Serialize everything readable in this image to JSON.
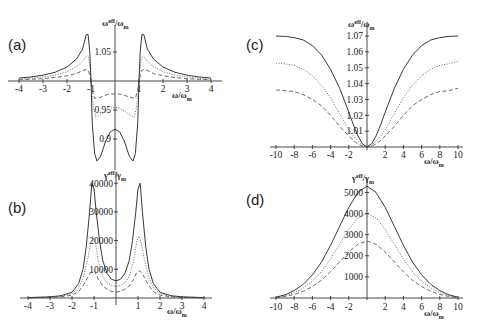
{
  "chart_data": [
    {
      "id": "a",
      "panel_label": "(a)",
      "type": "line",
      "xlabel": "ω/ω_m",
      "ylabel": "ω^eff/ω_m",
      "xlim": [
        -4.1,
        4.1
      ],
      "x_ticks": [
        -4,
        -3,
        -2,
        -1,
        1,
        2,
        3,
        4
      ],
      "y_ticks": [
        1.05,
        0.95,
        0.9
      ],
      "axis_origin": [
        0,
        1.0
      ],
      "pixel_map": {
        "x0": 115,
        "px_per_x": 24,
        "y0": 81,
        "y_ref": 1.0,
        "px_per_y": 580
      },
      "series": [
        {
          "name": "solid",
          "style": "solid",
          "x": [
            -4,
            -3.5,
            -3,
            -2.5,
            -2,
            -1.6,
            -1.35,
            -1.2,
            -1.12,
            -1.05,
            -1.0,
            -0.95,
            -0.85,
            -0.75,
            -0.6,
            -0.4,
            -0.2,
            0,
            0.2,
            0.4,
            0.6,
            0.75,
            0.85,
            0.95,
            1.0,
            1.05,
            1.12,
            1.2,
            1.35,
            1.6,
            2,
            2.5,
            3,
            3.5,
            4
          ],
          "y": [
            1.005,
            1.007,
            1.01,
            1.015,
            1.024,
            1.038,
            1.055,
            1.08,
            1.08,
            1.05,
            1.0,
            0.93,
            0.875,
            0.862,
            0.87,
            0.895,
            0.912,
            0.917,
            0.912,
            0.895,
            0.87,
            0.862,
            0.875,
            0.93,
            1.0,
            1.05,
            1.08,
            1.08,
            1.055,
            1.038,
            1.024,
            1.015,
            1.01,
            1.007,
            1.005
          ]
        },
        {
          "name": "dotted",
          "style": "dotted",
          "x": [
            -4,
            -3.5,
            -3,
            -2.5,
            -2,
            -1.6,
            -1.35,
            -1.2,
            -1.1,
            -1.03,
            -0.98,
            -0.9,
            -0.8,
            -0.6,
            -0.4,
            -0.2,
            0,
            0.2,
            0.4,
            0.6,
            0.8,
            0.9,
            0.98,
            1.03,
            1.1,
            1.2,
            1.35,
            1.6,
            2,
            2.5,
            3,
            3.5,
            4
          ],
          "y": [
            1.003,
            1.005,
            1.007,
            1.01,
            1.016,
            1.025,
            1.034,
            1.042,
            1.04,
            1.02,
            0.99,
            0.955,
            0.938,
            0.942,
            0.948,
            0.953,
            0.955,
            0.953,
            0.948,
            0.942,
            0.938,
            0.955,
            0.99,
            1.02,
            1.04,
            1.042,
            1.034,
            1.025,
            1.016,
            1.01,
            1.007,
            1.005,
            1.003
          ]
        },
        {
          "name": "dashed",
          "style": "dashed",
          "x": [
            -4,
            -3.5,
            -3,
            -2.5,
            -2,
            -1.6,
            -1.35,
            -1.2,
            -1.1,
            -1.0,
            -0.95,
            -0.85,
            -0.6,
            -0.3,
            0,
            0.3,
            0.6,
            0.85,
            0.95,
            1.0,
            1.1,
            1.2,
            1.35,
            1.6,
            2,
            2.5,
            3,
            3.5,
            4
          ],
          "y": [
            1.002,
            1.003,
            1.004,
            1.006,
            1.009,
            1.013,
            1.018,
            1.02,
            1.018,
            1.0,
            0.985,
            0.97,
            0.972,
            0.977,
            0.978,
            0.977,
            0.972,
            0.97,
            0.985,
            1.0,
            1.018,
            1.02,
            1.018,
            1.013,
            1.009,
            1.006,
            1.004,
            1.003,
            1.002
          ]
        }
      ]
    },
    {
      "id": "b",
      "panel_label": "(b)",
      "type": "line",
      "xlabel": "ω/ω_m",
      "ylabel": "γ^eff/γ_m",
      "xlim": [
        -4.1,
        4.1
      ],
      "ylim": [
        0,
        40000
      ],
      "x_ticks": [
        -4,
        -3,
        -2,
        -1,
        1,
        2,
        3,
        4
      ],
      "y_ticks": [
        10000,
        20000,
        30000,
        40000
      ],
      "pixel_map": {
        "x0": 116,
        "px_per_x": 22,
        "y0": 298,
        "y_ref": 0,
        "px_per_y": 0.00287
      },
      "series": [
        {
          "name": "solid",
          "style": "solid",
          "x": [
            -4,
            -3,
            -2.5,
            -2,
            -1.7,
            -1.5,
            -1.35,
            -1.2,
            -1.1,
            -1.0,
            -0.9,
            -0.75,
            -0.6,
            -0.4,
            -0.2,
            0,
            0.2,
            0.4,
            0.6,
            0.75,
            0.9,
            1.0,
            1.1,
            1.2,
            1.35,
            1.5,
            1.7,
            2,
            2.5,
            3,
            4
          ],
          "y": [
            150,
            400,
            800,
            2000,
            5000,
            10000,
            18000,
            30000,
            40000,
            38000,
            30000,
            20000,
            13000,
            8500,
            6500,
            6000,
            6500,
            8500,
            13000,
            20000,
            30000,
            38000,
            40000,
            30000,
            18000,
            10000,
            5000,
            2000,
            800,
            400,
            150
          ]
        },
        {
          "name": "dotted",
          "style": "dotted",
          "x": [
            -4,
            -3,
            -2.5,
            -2,
            -1.7,
            -1.5,
            -1.3,
            -1.15,
            -1.05,
            -0.95,
            -0.8,
            -0.6,
            -0.4,
            -0.2,
            0,
            0.2,
            0.4,
            0.6,
            0.8,
            0.95,
            1.05,
            1.15,
            1.3,
            1.5,
            1.7,
            2,
            2.5,
            3,
            4
          ],
          "y": [
            100,
            300,
            600,
            1500,
            3500,
            7000,
            13000,
            19000,
            21500,
            20000,
            13000,
            7500,
            5200,
            4300,
            4000,
            4300,
            5200,
            7500,
            13000,
            20000,
            21500,
            19000,
            13000,
            7000,
            3500,
            1500,
            600,
            300,
            100
          ]
        },
        {
          "name": "dashed",
          "style": "dashed",
          "x": [
            -4,
            -3,
            -2.5,
            -2,
            -1.7,
            -1.5,
            -1.3,
            -1.15,
            -1.05,
            -0.95,
            -0.8,
            -0.6,
            -0.4,
            -0.2,
            0,
            0.2,
            0.4,
            0.6,
            0.8,
            0.95,
            1.05,
            1.15,
            1.3,
            1.5,
            1.7,
            2,
            2.5,
            3,
            4
          ],
          "y": [
            60,
            200,
            400,
            1000,
            2200,
            4200,
            7000,
            9000,
            9500,
            9000,
            6500,
            4200,
            3000,
            2300,
            2100,
            2300,
            3000,
            4200,
            6500,
            9000,
            9500,
            9000,
            7000,
            4200,
            2200,
            1000,
            400,
            200,
            60
          ]
        }
      ]
    },
    {
      "id": "c",
      "panel_label": "(c)",
      "type": "line",
      "xlabel": "ω/ω_m",
      "ylabel": "ω^eff/ω_m",
      "xlim": [
        -10,
        10
      ],
      "ylim": [
        1.0,
        1.07
      ],
      "x_ticks": [
        -10,
        -8,
        -6,
        -4,
        -2,
        2,
        4,
        6,
        8,
        10
      ],
      "y_ticks": [
        1.01,
        1.02,
        1.03,
        1.04,
        1.05,
        1.06,
        1.07
      ],
      "pixel_map": {
        "x0": 367,
        "px_per_x": 9.1,
        "y0": 147,
        "y_ref": 1.0,
        "px_per_y": 1585
      },
      "series": [
        {
          "name": "solid",
          "style": "solid",
          "x": [
            -10,
            -9,
            -8,
            -7,
            -6,
            -5,
            -4,
            -3,
            -2,
            -1.5,
            -1,
            -0.5,
            0,
            0.5,
            1,
            1.5,
            2,
            3,
            4,
            5,
            6,
            7,
            8,
            9,
            10
          ],
          "y": [
            1.07,
            1.0698,
            1.069,
            1.0675,
            1.064,
            1.058,
            1.049,
            1.037,
            1.022,
            1.014,
            1.007,
            1.002,
            1.0,
            1.002,
            1.007,
            1.014,
            1.022,
            1.037,
            1.049,
            1.058,
            1.064,
            1.0675,
            1.069,
            1.0698,
            1.07
          ]
        },
        {
          "name": "dotted",
          "style": "dotted",
          "x": [
            -10,
            -9,
            -8,
            -7,
            -6,
            -5,
            -4,
            -3,
            -2,
            -1.5,
            -1,
            -0.5,
            0,
            0.5,
            1,
            1.5,
            2,
            3,
            4,
            5,
            6,
            7,
            8,
            9,
            10
          ],
          "y": [
            1.053,
            1.0525,
            1.0515,
            1.049,
            1.045,
            1.039,
            1.031,
            1.021,
            1.011,
            1.007,
            1.004,
            1.001,
            1.0,
            1.001,
            1.004,
            1.007,
            1.011,
            1.021,
            1.031,
            1.039,
            1.045,
            1.049,
            1.0515,
            1.0525,
            1.054
          ]
        },
        {
          "name": "dashed",
          "style": "dashed",
          "x": [
            -10,
            -9,
            -8,
            -7,
            -6,
            -5,
            -4,
            -3,
            -2,
            -1.5,
            -1,
            -0.5,
            0,
            0.5,
            1,
            1.5,
            2,
            3,
            4,
            5,
            6,
            7,
            8,
            9,
            10
          ],
          "y": [
            1.036,
            1.0355,
            1.035,
            1.033,
            1.03,
            1.026,
            1.02,
            1.013,
            1.007,
            1.004,
            1.002,
            1.0005,
            1.0,
            1.0005,
            1.002,
            1.004,
            1.007,
            1.013,
            1.02,
            1.026,
            1.03,
            1.033,
            1.035,
            1.0355,
            1.037
          ]
        }
      ]
    },
    {
      "id": "d",
      "panel_label": "(d)",
      "type": "line",
      "xlabel": "ω/ω_m",
      "ylabel": "γ^eff/γ_m",
      "xlim": [
        -10,
        10
      ],
      "ylim": [
        0,
        5000
      ],
      "x_ticks": [
        -10,
        -8,
        -6,
        -4,
        -2,
        2,
        4,
        6,
        8,
        10
      ],
      "y_ticks": [
        1000,
        2000,
        3000,
        4000,
        5000
      ],
      "pixel_map": {
        "x0": 367,
        "px_per_x": 9.1,
        "y0": 298,
        "y_ref": 0,
        "px_per_y": 0.0211
      },
      "series": [
        {
          "name": "solid",
          "style": "solid",
          "x": [
            -10,
            -9,
            -8,
            -7,
            -6,
            -5,
            -4,
            -3,
            -2,
            -1,
            0,
            1,
            2,
            3,
            4,
            5,
            6,
            7,
            8,
            9,
            10
          ],
          "y": [
            40,
            150,
            350,
            650,
            1100,
            1700,
            2500,
            3400,
            4300,
            5000,
            5300,
            5000,
            4300,
            3400,
            2500,
            1700,
            1100,
            650,
            350,
            150,
            40
          ]
        },
        {
          "name": "dotted",
          "style": "dotted",
          "x": [
            -10,
            -9,
            -8,
            -7,
            -6,
            -5,
            -4,
            -3,
            -2,
            -1,
            0,
            1,
            2,
            3,
            4,
            5,
            6,
            7,
            8,
            9,
            10
          ],
          "y": [
            30,
            110,
            250,
            480,
            800,
            1250,
            1850,
            2550,
            3250,
            3800,
            4000,
            3800,
            3250,
            2550,
            1850,
            1250,
            800,
            480,
            250,
            110,
            30
          ]
        },
        {
          "name": "dashed",
          "style": "dashed",
          "x": [
            -10,
            -9,
            -8,
            -7,
            -6,
            -5,
            -4,
            -3,
            -2,
            -1,
            0,
            1,
            2,
            3,
            4,
            5,
            6,
            7,
            8,
            9,
            10
          ],
          "y": [
            20,
            70,
            170,
            320,
            540,
            840,
            1250,
            1720,
            2180,
            2550,
            2700,
            2550,
            2180,
            1720,
            1250,
            840,
            540,
            320,
            170,
            70,
            20
          ]
        }
      ]
    }
  ],
  "layout": {
    "panels": [
      {
        "id": "a",
        "label_pos": [
          8,
          50
        ],
        "x_axis_px": [
          8,
          222
        ],
        "y_axis_px": [
          25,
          170
        ],
        "xlabel_pos": [
          172,
          98
        ],
        "ylabel_pos": [
          102,
          26
        ],
        "ylabel_text": "ωeff/ωm",
        "xlabel_text": "ω/ωm",
        "tick_x_y": 92,
        "tick_y_x": 111,
        "tick_y_labels": [
          "1.05",
          "0.95",
          "0.9"
        ]
      },
      {
        "id": "b",
        "label_pos": [
          8,
          213
        ],
        "x_axis_px": [
          20,
          212
        ],
        "y_axis_px": [
          172,
          305
        ],
        "xlabel_pos": [
          167,
          314
        ],
        "ylabel_pos": [
          104,
          178
        ],
        "ylabel_text": "γeff/γm",
        "xlabel_text": "ω/ωm",
        "tick_x_y": 309,
        "tick_y_x": 113,
        "tick_y_labels": [
          "40000",
          "30000",
          "20000",
          "10000"
        ]
      },
      {
        "id": "c",
        "label_pos": [
          246,
          50
        ],
        "x_axis_px": [
          270,
          463
        ],
        "y_axis_px": [
          22,
          150
        ],
        "xlabel_pos": [
          424,
          164
        ],
        "ylabel_pos": [
          348,
          27
        ],
        "ylabel_text": "ωeff/ωm",
        "xlabel_text": "ω/ωm",
        "tick_x_y": 158,
        "tick_y_x": 363,
        "tick_y_labels": [
          "1.07",
          "1.06",
          "1.05",
          "1.04",
          "1.03",
          "1.02",
          "1.01"
        ]
      },
      {
        "id": "d",
        "label_pos": [
          246,
          205
        ],
        "x_axis_px": [
          270,
          463
        ],
        "y_axis_px": [
          178,
          300
        ],
        "xlabel_pos": [
          424,
          316
        ],
        "ylabel_pos": [
          352,
          181
        ],
        "ylabel_text": "γeff/γm",
        "xlabel_text": "ω/ωm",
        "tick_x_y": 310,
        "tick_y_x": 363,
        "tick_y_labels": [
          "5000",
          "4000",
          "3000",
          "2000",
          "1000"
        ]
      }
    ]
  }
}
